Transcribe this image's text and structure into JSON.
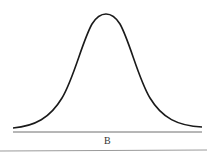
{
  "figure": {
    "type": "normal-distribution-curve",
    "axis_label": "B",
    "colors": {
      "curve": "#1a1a1a",
      "axis": "#6e6e6e",
      "rule": "#9a9a9a",
      "background": "#ffffff"
    }
  }
}
